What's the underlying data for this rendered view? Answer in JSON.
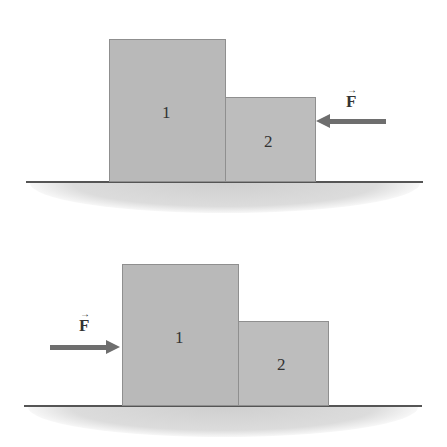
{
  "diagrams": [
    {
      "id": "top",
      "blocks": [
        {
          "label": "1",
          "x": 109,
          "y": 39,
          "w": 116,
          "h": 143
        },
        {
          "label": "2",
          "x": 225,
          "y": 97,
          "w": 90,
          "h": 85
        }
      ],
      "ground": {
        "x1": 26,
        "x2": 423,
        "y": 181
      },
      "force": {
        "label": "F",
        "vector_mark": "→",
        "direction": "left",
        "tail_x": 386,
        "tip_x": 316,
        "y": 121,
        "label_x": 346,
        "label_y": 92
      }
    },
    {
      "id": "bottom",
      "blocks": [
        {
          "label": "1",
          "x": 122,
          "y": 264,
          "w": 116,
          "h": 142
        },
        {
          "label": "2",
          "x": 238,
          "y": 321,
          "w": 90,
          "h": 85
        }
      ],
      "ground": {
        "x1": 24,
        "x2": 422,
        "y": 405
      },
      "force": {
        "label": "F",
        "vector_mark": "→",
        "direction": "right",
        "tail_x": 50,
        "tip_x": 120,
        "y": 347,
        "label_x": 79,
        "label_y": 316
      }
    }
  ],
  "colors": {
    "block_fill": "#b9b9b9",
    "block_fill_2": "#bdbdbd",
    "ground_line": "#555555",
    "ground_fill": "#d4d4d4",
    "arrow": "#6e6e6e"
  }
}
